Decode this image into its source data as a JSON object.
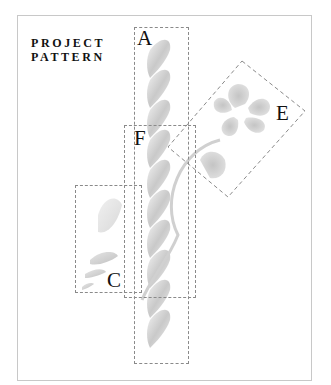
{
  "title": {
    "line1": "PROJECT",
    "line2": "PATTERN"
  },
  "boxes": [
    {
      "id": "A",
      "label": "A",
      "description": "twisted rope column"
    },
    {
      "id": "F",
      "label": "F",
      "description": "rope with curved stem"
    },
    {
      "id": "C",
      "label": "C",
      "description": "leaves"
    },
    {
      "id": "E",
      "label": "E",
      "description": "five-petal flower"
    }
  ],
  "colors": {
    "frame": "#c8c8c8",
    "dashed": "#8a8a8a",
    "motif": "#bdbdbd",
    "text": "#111111"
  }
}
